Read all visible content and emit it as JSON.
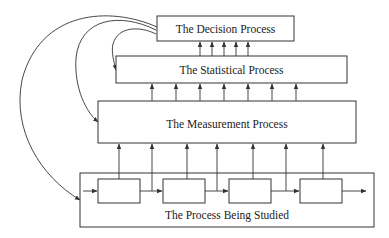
{
  "diagram": {
    "type": "layered-process-flow",
    "boxes": {
      "decision": "The Decision Process",
      "statistical": "The Statistical Process",
      "measurement": "The Measurement Process",
      "process": "The Process Being Studied"
    },
    "process_steps": 4,
    "arrows_measurement_to_statistical": 7,
    "arrows_statistical_to_decision": 5,
    "arrows_process_to_measurement": 7,
    "feedback_loops": [
      {
        "from": "The Decision Process",
        "to": "The Statistical Process"
      },
      {
        "from": "The Decision Process",
        "to": "The Measurement Process"
      },
      {
        "from": "The Decision Process",
        "to": "The Process Being Studied"
      }
    ],
    "colors": {
      "stroke": "#333333",
      "background": "#ffffff",
      "text": "#222222"
    }
  }
}
